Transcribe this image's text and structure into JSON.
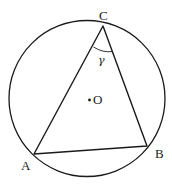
{
  "diagram": {
    "type": "inscribed-triangle-in-circle",
    "colors": {
      "stroke": "#1a1a1a",
      "background": "#ffffff"
    },
    "circle": {
      "cx": 87,
      "cy": 98,
      "r": 78
    },
    "center": {
      "label": "O",
      "x": 89,
      "y": 100
    },
    "vertices": [
      {
        "label": "A",
        "x": 34,
        "y": 154
      },
      {
        "label": "B",
        "x": 147,
        "y": 146
      },
      {
        "label": "C",
        "x": 103,
        "y": 26
      }
    ],
    "angle": {
      "label": "γ",
      "at": "C"
    },
    "labels": {
      "A": "A",
      "B": "B",
      "C": "C",
      "O": "O",
      "gamma": "γ"
    }
  }
}
